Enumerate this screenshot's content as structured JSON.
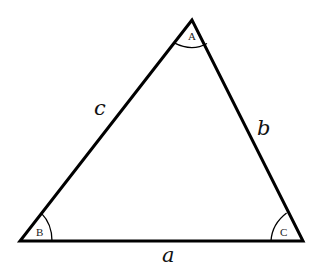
{
  "diagram": {
    "type": "triangle",
    "vertices": [
      {
        "id": "A",
        "label": "A",
        "x": 192,
        "y": 20
      },
      {
        "id": "B",
        "label": "B",
        "x": 20,
        "y": 241
      },
      {
        "id": "C",
        "label": "C",
        "x": 303,
        "y": 241
      }
    ],
    "sides": [
      {
        "id": "a",
        "label": "a",
        "between": [
          "B",
          "C"
        ]
      },
      {
        "id": "b",
        "label": "b",
        "between": [
          "A",
          "C"
        ]
      },
      {
        "id": "c",
        "label": "c",
        "between": [
          "A",
          "B"
        ]
      }
    ],
    "colors": {
      "stroke": "#000000",
      "background": "#ffffff"
    }
  }
}
